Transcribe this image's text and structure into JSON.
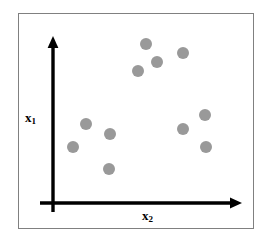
{
  "figure": {
    "type": "scatter-plot-diagram",
    "background_color": "#ffffff",
    "frame_border_color": "#808080",
    "axis_color": "#000000",
    "point_color": "#999999"
  },
  "axes": {
    "y_axis": {
      "name": "x1",
      "label_base": "x",
      "label_sub": "1",
      "origin_px": [
        53,
        203
      ],
      "tip_px": [
        53,
        38
      ],
      "arrow": "up"
    },
    "x_axis": {
      "name": "x2",
      "label_base": "x",
      "label_sub": "2",
      "origin_px": [
        53,
        203
      ],
      "tip_px": [
        241,
        203
      ],
      "arrow": "right"
    }
  },
  "chart_data": {
    "type": "scatter",
    "title": "",
    "subtitle": "",
    "xlabel": "x2",
    "ylabel": "x1",
    "grid": false,
    "legend": null,
    "axis_ticks": [],
    "axis_tick_labels": [],
    "xlim": [
      0,
      10
    ],
    "ylim": [
      0,
      10
    ],
    "marker": {
      "shape": "circle",
      "color": "#999999",
      "diameter_px": 12
    },
    "note": "Unlabeled conceptual scatter plot; axes have no numeric ticks. Values below are read off the pixel positions mapped to a 0-10 unit box with origin at the axis crossing.",
    "series": [
      {
        "name": "points",
        "color": "#999999",
        "points_px": [
          [
            146,
            44
          ],
          [
            157,
            62
          ],
          [
            138,
            71
          ],
          [
            183,
            53
          ],
          [
            86,
            124
          ],
          [
            110,
            134
          ],
          [
            73,
            147
          ],
          [
            109,
            169
          ],
          [
            205,
            115
          ],
          [
            183,
            129
          ],
          [
            206,
            147
          ]
        ],
        "x": [
          4.95,
          5.53,
          4.52,
          6.91,
          1.76,
          3.03,
          1.06,
          2.98,
          8.09,
          6.91,
          8.14
        ],
        "y": [
          9.64,
          8.55,
          8.0,
          9.09,
          4.79,
          4.18,
          3.39,
          2.06,
          5.33,
          4.48,
          3.39
        ]
      }
    ]
  }
}
